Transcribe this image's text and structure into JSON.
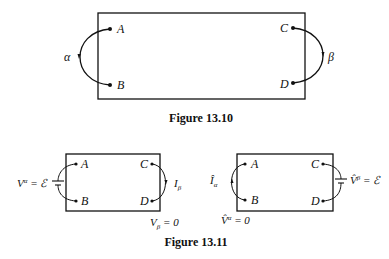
{
  "figures": [
    {
      "caption": "Figure 13.10",
      "terminals": [
        "A",
        "B",
        "C",
        "D"
      ],
      "left_port": {
        "label": "α",
        "from": "A",
        "to": "B",
        "element": "arrow"
      },
      "right_port": {
        "label": "β",
        "from": "C",
        "to": "D",
        "element": "arrow"
      }
    },
    {
      "caption": "Figure 13.11",
      "panels": [
        {
          "terminals": [
            "A",
            "B",
            "C",
            "D"
          ],
          "left_port": {
            "element": "battery",
            "label_main": "V",
            "label_sup": "α",
            "label_rest": " = ℰ"
          },
          "right_port": {
            "element": "current-arrow",
            "label_main": "I",
            "label_sub": "β"
          },
          "condition": {
            "main": "V",
            "sub": "β",
            "rest": " = 0"
          }
        },
        {
          "terminals": [
            "A",
            "B",
            "C",
            "D"
          ],
          "left_port": {
            "element": "current-arrow",
            "label_main": "Î",
            "label_sub": "α"
          },
          "right_port": {
            "element": "battery",
            "label_main": "V̂",
            "label_sup": "β",
            "label_rest": " = ℰ"
          },
          "condition": {
            "main": "V̂",
            "sup": "α",
            "rest": " = 0"
          }
        }
      ]
    }
  ]
}
